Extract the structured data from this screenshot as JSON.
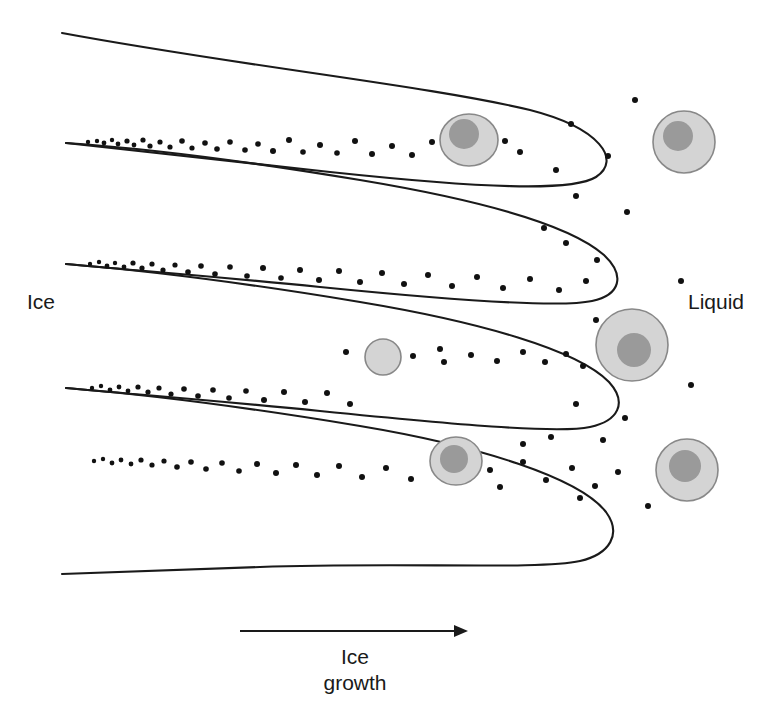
{
  "figure": {
    "background_color": "#ffffff",
    "line_color": "#1a1a1a",
    "width": 775,
    "height": 722
  },
  "labels": {
    "ice": "Ice",
    "liquid": "Liquid",
    "growth_line1": "Ice",
    "growth_line2": "growth"
  },
  "arrow": {
    "name": "ice-growth-arrow",
    "x1": 240,
    "y1": 631,
    "x2": 468,
    "y2": 631,
    "direction": "right",
    "color": "#1a1a1a",
    "stroke_width": 2
  },
  "chart_data": {
    "type": "diagram",
    "xlabel": "",
    "ylabel": "",
    "annotations": [
      "Ice",
      "Liquid",
      "Ice growth"
    ],
    "legend": [],
    "dendrites": [
      {
        "name": "dendrite-curve-1",
        "path": "M 62,33 C 240,66 430,86 530,110 C 600,128 622,160 596,177 C 572,192 480,188 330,172 C 220,160 130,150 66,143"
      },
      {
        "name": "dendrite-curve-2",
        "path": "M 66,143 C 140,148 240,160 360,180 C 480,200 570,225 604,255 C 626,276 620,295 592,301 C 560,308 450,300 320,287 C 210,276 130,270 66,264"
      },
      {
        "name": "dendrite-curve-3",
        "path": "M 66,264 C 140,270 240,282 360,302 C 480,322 578,350 609,382 C 628,403 618,421 590,427 C 558,434 450,424 320,411 C 210,400 130,394 66,388"
      },
      {
        "name": "dendrite-curve-4",
        "path": "M 66,388 C 140,394 240,406 360,426 C 480,446 580,478 606,512 C 622,534 610,554 580,561 C 540,570 400,562 260,567 C 180,570 120,572 62,574"
      }
    ],
    "cells": [
      {
        "name": "cell-trapped-upper",
        "cx": 469,
        "cy": 140,
        "rx": 29,
        "ry": 26,
        "nucleus_cx": 464,
        "nucleus_cy": 134,
        "nucleus_r": 15,
        "state": "compressed-in-channel"
      },
      {
        "name": "cell-liquid-upper-right",
        "cx": 684,
        "cy": 142,
        "rx": 31,
        "ry": 31,
        "nucleus_cx": 678,
        "nucleus_cy": 136,
        "nucleus_r": 15,
        "state": "free-in-liquid"
      },
      {
        "name": "cell-shrunken-middle",
        "cx": 383,
        "cy": 357,
        "rx": 18,
        "ry": 18,
        "nucleus_cx": 383,
        "nucleus_cy": 357,
        "nucleus_r": 0,
        "state": "dehydrated-small"
      },
      {
        "name": "cell-liquid-middle-right",
        "cx": 632,
        "cy": 345,
        "rx": 36,
        "ry": 36,
        "nucleus_cx": 634,
        "nucleus_cy": 350,
        "nucleus_r": 17,
        "state": "free-in-liquid"
      },
      {
        "name": "cell-trapped-lower",
        "cx": 456,
        "cy": 461,
        "rx": 26,
        "ry": 24,
        "nucleus_cx": 454,
        "nucleus_cy": 459,
        "nucleus_r": 14,
        "state": "compressed-in-channel"
      },
      {
        "name": "cell-liquid-lower-right",
        "cx": 687,
        "cy": 470,
        "rx": 31,
        "ry": 31,
        "nucleus_cx": 685,
        "nucleus_cy": 466,
        "nucleus_r": 16,
        "state": "free-in-liquid"
      }
    ],
    "cell_colors": {
      "membrane_stroke": "#888888",
      "cytoplasm_fill": "#d4d4d4",
      "nucleus_fill": "#9a9a9a"
    },
    "solute_dot_color": "#111111",
    "solute_dots": [
      [
        88,
        142,
        2.2
      ],
      [
        97,
        141,
        2.2
      ],
      [
        104,
        143,
        2.4
      ],
      [
        112,
        140,
        2.2
      ],
      [
        118,
        144,
        2.4
      ],
      [
        127,
        141,
        2.6
      ],
      [
        134,
        145,
        2.4
      ],
      [
        143,
        140,
        2.6
      ],
      [
        150,
        146,
        2.6
      ],
      [
        160,
        142,
        2.6
      ],
      [
        170,
        147,
        2.6
      ],
      [
        182,
        141,
        2.8
      ],
      [
        192,
        148,
        2.6
      ],
      [
        205,
        143,
        2.8
      ],
      [
        217,
        149,
        2.8
      ],
      [
        230,
        142,
        2.8
      ],
      [
        245,
        150,
        2.8
      ],
      [
        258,
        144,
        2.8
      ],
      [
        273,
        151,
        3.0
      ],
      [
        289,
        140,
        3.0
      ],
      [
        303,
        152,
        2.8
      ],
      [
        320,
        145,
        3.0
      ],
      [
        337,
        153,
        2.8
      ],
      [
        355,
        141,
        3.0
      ],
      [
        372,
        154,
        3.0
      ],
      [
        392,
        146,
        3.0
      ],
      [
        412,
        155,
        3.0
      ],
      [
        432,
        142,
        3.0
      ],
      [
        505,
        141,
        3.0
      ],
      [
        520,
        152,
        3.0
      ],
      [
        90,
        264,
        2.2
      ],
      [
        99,
        262,
        2.2
      ],
      [
        107,
        266,
        2.4
      ],
      [
        115,
        263,
        2.2
      ],
      [
        124,
        267,
        2.4
      ],
      [
        133,
        263,
        2.6
      ],
      [
        142,
        268,
        2.6
      ],
      [
        152,
        264,
        2.6
      ],
      [
        163,
        270,
        2.6
      ],
      [
        175,
        265,
        2.6
      ],
      [
        188,
        272,
        2.8
      ],
      [
        201,
        266,
        2.8
      ],
      [
        215,
        274,
        2.8
      ],
      [
        230,
        267,
        2.8
      ],
      [
        247,
        276,
        2.8
      ],
      [
        263,
        268,
        3.0
      ],
      [
        281,
        278,
        2.8
      ],
      [
        300,
        270,
        3.0
      ],
      [
        319,
        280,
        3.0
      ],
      [
        339,
        271,
        3.0
      ],
      [
        360,
        282,
        3.0
      ],
      [
        382,
        273,
        3.0
      ],
      [
        404,
        284,
        3.0
      ],
      [
        428,
        275,
        3.0
      ],
      [
        452,
        286,
        3.0
      ],
      [
        477,
        277,
        3.0
      ],
      [
        503,
        288,
        3.0
      ],
      [
        530,
        279,
        3.0
      ],
      [
        559,
        290,
        3.0
      ],
      [
        586,
        281,
        3.0
      ],
      [
        92,
        388,
        2.2
      ],
      [
        101,
        386,
        2.2
      ],
      [
        110,
        390,
        2.4
      ],
      [
        119,
        387,
        2.4
      ],
      [
        128,
        391,
        2.4
      ],
      [
        138,
        387,
        2.6
      ],
      [
        148,
        392,
        2.6
      ],
      [
        159,
        388,
        2.6
      ],
      [
        171,
        394,
        2.6
      ],
      [
        184,
        389,
        2.8
      ],
      [
        198,
        396,
        2.8
      ],
      [
        213,
        390,
        2.8
      ],
      [
        229,
        398,
        2.8
      ],
      [
        246,
        391,
        2.8
      ],
      [
        264,
        400,
        3.0
      ],
      [
        284,
        392,
        3.0
      ],
      [
        305,
        402,
        3.0
      ],
      [
        327,
        393,
        3.0
      ],
      [
        350,
        404,
        3.0
      ],
      [
        346,
        352,
        3.0
      ],
      [
        413,
        356,
        3.0
      ],
      [
        440,
        349,
        3.0
      ],
      [
        444,
        362,
        3.0
      ],
      [
        471,
        355,
        3.0
      ],
      [
        497,
        361,
        3.0
      ],
      [
        523,
        352,
        3.0
      ],
      [
        545,
        362,
        3.0
      ],
      [
        566,
        354,
        3.0
      ],
      [
        583,
        366,
        3.0
      ],
      [
        94,
        461,
        2.2
      ],
      [
        103,
        459,
        2.2
      ],
      [
        112,
        463,
        2.4
      ],
      [
        121,
        460,
        2.4
      ],
      [
        131,
        464,
        2.4
      ],
      [
        141,
        460,
        2.6
      ],
      [
        152,
        465,
        2.6
      ],
      [
        164,
        461,
        2.6
      ],
      [
        177,
        467,
        2.8
      ],
      [
        191,
        462,
        2.8
      ],
      [
        206,
        469,
        2.8
      ],
      [
        222,
        463,
        2.8
      ],
      [
        239,
        471,
        2.8
      ],
      [
        257,
        464,
        3.0
      ],
      [
        276,
        473,
        3.0
      ],
      [
        296,
        465,
        3.0
      ],
      [
        317,
        475,
        3.0
      ],
      [
        339,
        466,
        3.0
      ],
      [
        362,
        477,
        3.0
      ],
      [
        386,
        468,
        3.0
      ],
      [
        411,
        479,
        3.0
      ],
      [
        490,
        470,
        3.0
      ],
      [
        500,
        487,
        3.0
      ],
      [
        523,
        462,
        3.0
      ],
      [
        546,
        480,
        3.0
      ],
      [
        572,
        468,
        3.0
      ],
      [
        595,
        486,
        3.0
      ],
      [
        618,
        472,
        3.0
      ],
      [
        635,
        100,
        3.0
      ],
      [
        608,
        156,
        3.0
      ],
      [
        571,
        124,
        3.0
      ],
      [
        556,
        170,
        3.0
      ],
      [
        576,
        196,
        3.0
      ],
      [
        627,
        212,
        3.0
      ],
      [
        566,
        243,
        3.0
      ],
      [
        597,
        260,
        3.0
      ],
      [
        544,
        228,
        3.0
      ],
      [
        681,
        281,
        3.0
      ],
      [
        596,
        320,
        3.0
      ],
      [
        691,
        385,
        3.0
      ],
      [
        576,
        404,
        3.0
      ],
      [
        603,
        440,
        3.0
      ],
      [
        625,
        418,
        3.0
      ],
      [
        551,
        437,
        3.0
      ],
      [
        523,
        444,
        3.0
      ],
      [
        648,
        506,
        3.0
      ],
      [
        580,
        498,
        3.0
      ]
    ]
  }
}
